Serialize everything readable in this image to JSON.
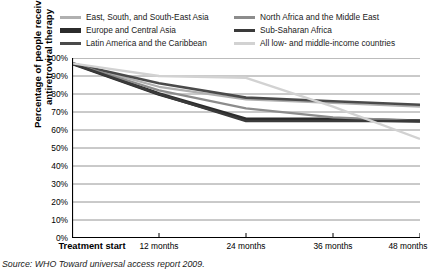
{
  "chart_data": {
    "type": "line",
    "title": "",
    "xlabel": "",
    "ylabel": "Percentage of people receiving antiretroviral therapy",
    "ylabel_line1": "Percentage of people receiving",
    "ylabel_line2": "antiretroviral therapy",
    "categories": [
      "Treatment start",
      "12 months",
      "24 months",
      "36 months",
      "48 months"
    ],
    "x": [
      0,
      12,
      24,
      36,
      48
    ],
    "ylim": [
      0,
      100
    ],
    "xlim": [
      0,
      48
    ],
    "grid": true,
    "grid_axis": "y",
    "legend_position": "top",
    "y_ticks": [
      0,
      10,
      20,
      30,
      40,
      50,
      60,
      70,
      80,
      90,
      100
    ],
    "y_tick_labels": [
      "0%",
      "10%",
      "20%",
      "30%",
      "40%",
      "50%",
      "60%",
      "70%",
      "80%",
      "90%",
      "100%"
    ],
    "series": [
      {
        "name": "East, South, and South-East Asia",
        "color": "#b0b0b0",
        "width": 2.2,
        "values": [
          97,
          84,
          77,
          75,
          73
        ]
      },
      {
        "name": "Europe and Central Asia",
        "color": "#2b2b2b",
        "width": 3.6,
        "values": [
          97,
          80,
          66,
          66,
          65
        ]
      },
      {
        "name": "Latin America and the Caribbean",
        "color": "#4a4a4a",
        "width": 2.6,
        "values": [
          97,
          86,
          78,
          76,
          74
        ]
      },
      {
        "name": "North Africa and the Middle East",
        "color": "#8c8c8c",
        "width": 2.2,
        "values": [
          97,
          82,
          72,
          67,
          65
        ]
      },
      {
        "name": "Sub-Saharan Africa",
        "color": "#3a3a3a",
        "width": 2.4,
        "values": [
          97,
          80,
          65,
          65,
          65
        ]
      },
      {
        "name": "All low- and middle-income countries",
        "color": "#d2d2d2",
        "width": 2.4,
        "values": [
          97,
          90,
          89,
          73,
          55
        ]
      }
    ]
  },
  "legend": {
    "columns": [
      {
        "items": [
          {
            "label": "East, South, and South-East Asia",
            "color": "#b0b0b0",
            "width": 3
          },
          {
            "label": "Europe and Central Asia",
            "color": "#2b2b2b",
            "width": 5
          },
          {
            "label": "Latin America and the Caribbean",
            "color": "#4a4a4a",
            "width": 3.5
          }
        ]
      },
      {
        "items": [
          {
            "label": "North Africa and the Middle East",
            "color": "#8c8c8c",
            "width": 3
          },
          {
            "label": "Sub-Saharan Africa",
            "color": "#3a3a3a",
            "width": 3.2
          },
          {
            "label": "All low- and middle-income countries",
            "color": "#d2d2d2",
            "width": 3.2
          }
        ]
      }
    ]
  },
  "source": {
    "text": "Source: WHO Toward universal access report 2009."
  },
  "colors": {
    "axis": "#000000",
    "grid": "#7a7a7a",
    "text": "#000000"
  }
}
